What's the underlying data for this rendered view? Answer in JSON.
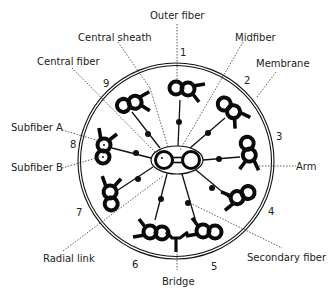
{
  "diagram": {
    "type": "cross-section",
    "labels": {
      "outer_fiber": "Outer fiber",
      "central_sheath": "Central sheath",
      "midfiber": "Midfiber",
      "membrane": "Membrane",
      "central_fiber": "Central fiber",
      "subfiber_a": "Subfiber A",
      "subfiber_b": "Subfiber B",
      "arm": "Arm",
      "radial_link": "Radial link",
      "secondary_fiber": "Secondary fiber",
      "bridge": "Bridge"
    },
    "doublet_numbers": [
      "1",
      "2",
      "3",
      "4",
      "5",
      "6",
      "7",
      "8",
      "9"
    ],
    "colors": {
      "ink": "#0a0a0a",
      "text": "#222222",
      "background": "#ffffff"
    }
  }
}
